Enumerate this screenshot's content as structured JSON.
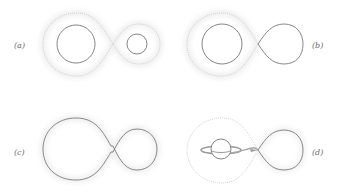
{
  "figure": {
    "type": "binary-star Roche lobe configurations",
    "panels": [
      {
        "id": "a",
        "label": "(a)",
        "description": "detached binary: both stars inside Roche lobes"
      },
      {
        "id": "b",
        "label": "(b)",
        "description": "semi-detached: secondary fills its Roche lobe"
      },
      {
        "id": "c",
        "label": "(c)",
        "description": "contact binary: common envelope"
      },
      {
        "id": "d",
        "label": "(d)",
        "description": "mass transfer via L1 stream onto accretion disk"
      }
    ]
  },
  "colors": {
    "star_outline": "#777777",
    "roche_lobe_dotted": "#c8c8c8",
    "background": "#ffffff"
  }
}
